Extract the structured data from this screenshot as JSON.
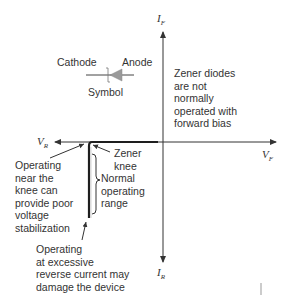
{
  "axes": {
    "if_label": "I",
    "if_sub": "F",
    "ir_label": "I",
    "ir_sub": "R",
    "vr_label": "V",
    "vr_sub": "R",
    "vf_label": "V",
    "vf_sub": "F"
  },
  "symbol": {
    "cathode": "Cathode",
    "anode": "Anode",
    "caption": "Symbol",
    "fill_color": "#9a9a9a"
  },
  "annotations": {
    "forward_note": "Zener diodes\nare not\nnormally\noperated with\nforward bias",
    "zener_knee": "Zener\nknee",
    "near_knee": "Operating\nnear the\nknee can\nprovide poor\nvoltage\nstabilization",
    "normal_range": "Normal\noperating\nrange",
    "excessive": "Operating\nat excessive\nreverse current may\ndamage the device"
  },
  "colors": {
    "axis": "#333333",
    "curve": "#1e1e1e"
  }
}
